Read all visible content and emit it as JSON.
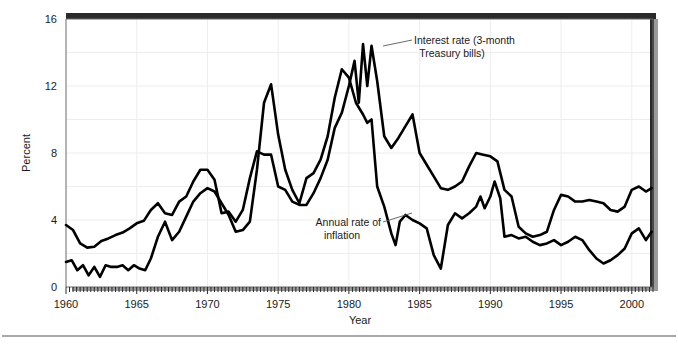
{
  "chart_data": {
    "type": "line",
    "title": "",
    "xlabel": "Year",
    "ylabel": "Percent",
    "xlim": [
      1960,
      2001.5
    ],
    "ylim": [
      0,
      16
    ],
    "yticks": [
      0,
      4,
      8,
      12,
      16
    ],
    "xticks": [
      1960,
      1965,
      1970,
      1975,
      1980,
      1985,
      1990,
      1995,
      2000
    ],
    "grid": "both-light",
    "legend": "inline-annotations",
    "minor_tick_interval": 0.25,
    "series": [
      {
        "name": "Interest rate (3-month Treasury bills)",
        "color": "#000000",
        "x": [
          1960.0,
          1960.5,
          1961.0,
          1961.5,
          1962.0,
          1962.5,
          1963.0,
          1963.5,
          1964.0,
          1964.5,
          1965.0,
          1965.5,
          1966.0,
          1966.5,
          1967.0,
          1967.5,
          1968.0,
          1968.5,
          1969.0,
          1969.5,
          1970.0,
          1970.5,
          1971.0,
          1971.5,
          1972.0,
          1972.5,
          1973.0,
          1973.5,
          1974.0,
          1974.5,
          1975.0,
          1975.5,
          1976.0,
          1976.5,
          1977.0,
          1977.5,
          1978.0,
          1978.5,
          1979.0,
          1979.5,
          1980.0,
          1980.4,
          1980.7,
          1981.0,
          1981.3,
          1981.6,
          1982.0,
          1982.5,
          1983.0,
          1983.5,
          1984.0,
          1984.5,
          1985.0,
          1985.5,
          1986.0,
          1986.5,
          1987.0,
          1987.5,
          1988.0,
          1988.5,
          1989.0,
          1989.5,
          1990.0,
          1990.5,
          1991.0,
          1991.5,
          1992.0,
          1992.5,
          1993.0,
          1993.5,
          1994.0,
          1994.5,
          1995.0,
          1995.5,
          1996.0,
          1996.5,
          1997.0,
          1997.5,
          1998.0,
          1998.5,
          1999.0,
          1999.5,
          2000.0,
          2000.5,
          2001.0,
          2001.4
        ],
        "y": [
          3.7,
          3.4,
          2.6,
          2.35,
          2.4,
          2.75,
          2.9,
          3.1,
          3.25,
          3.5,
          3.8,
          3.95,
          4.6,
          5.0,
          4.4,
          4.3,
          5.1,
          5.4,
          6.3,
          7.0,
          7.0,
          6.4,
          4.4,
          4.5,
          3.9,
          4.6,
          6.5,
          8.1,
          7.9,
          7.9,
          6.0,
          5.8,
          5.1,
          4.9,
          4.9,
          5.6,
          6.5,
          7.6,
          9.5,
          10.4,
          12.0,
          13.5,
          11.0,
          14.5,
          12.0,
          14.4,
          12.3,
          9.0,
          8.3,
          8.9,
          9.6,
          10.3,
          8.0,
          7.3,
          6.6,
          5.9,
          5.8,
          6.0,
          6.3,
          7.2,
          8.0,
          7.9,
          7.8,
          7.5,
          5.8,
          5.4,
          3.6,
          3.2,
          3.0,
          3.1,
          3.3,
          4.6,
          5.5,
          5.4,
          5.1,
          5.1,
          5.2,
          5.1,
          5.0,
          4.6,
          4.5,
          4.8,
          5.8,
          6.0,
          5.7,
          5.9
        ]
      },
      {
        "name": "Annual rate of inflation",
        "color": "#000000",
        "x": [
          1960.0,
          1960.4,
          1960.8,
          1961.2,
          1961.6,
          1962.0,
          1962.4,
          1962.8,
          1963.2,
          1963.6,
          1964.0,
          1964.4,
          1964.8,
          1965.2,
          1965.6,
          1966.0,
          1966.5,
          1967.0,
          1967.5,
          1968.0,
          1968.5,
          1969.0,
          1969.5,
          1970.0,
          1970.5,
          1971.0,
          1971.5,
          1972.0,
          1972.5,
          1973.0,
          1973.5,
          1974.0,
          1974.5,
          1975.0,
          1975.5,
          1976.0,
          1976.5,
          1977.0,
          1977.5,
          1978.0,
          1978.5,
          1979.0,
          1979.5,
          1980.0,
          1980.5,
          1981.0,
          1981.3,
          1981.6,
          1982.0,
          1982.5,
          1983.0,
          1983.3,
          1983.6,
          1984.0,
          1984.5,
          1985.0,
          1985.5,
          1986.0,
          1986.5,
          1987.0,
          1987.5,
          1988.0,
          1988.5,
          1989.0,
          1989.3,
          1989.6,
          1990.0,
          1990.3,
          1990.7,
          1991.0,
          1991.5,
          1992.0,
          1992.5,
          1993.0,
          1993.5,
          1994.0,
          1994.5,
          1995.0,
          1995.5,
          1996.0,
          1996.5,
          1997.0,
          1997.5,
          1998.0,
          1998.5,
          1999.0,
          1999.5,
          2000.0,
          2000.5,
          2001.0,
          2001.4
        ],
        "y": [
          1.5,
          1.6,
          1.0,
          1.3,
          0.7,
          1.2,
          0.6,
          1.3,
          1.2,
          1.2,
          1.3,
          1.0,
          1.3,
          1.1,
          1.0,
          1.7,
          3.0,
          3.9,
          2.8,
          3.3,
          4.2,
          5.1,
          5.6,
          5.9,
          5.7,
          5.0,
          4.3,
          3.3,
          3.4,
          3.9,
          7.0,
          11.0,
          12.1,
          9.1,
          7.0,
          5.8,
          5.0,
          6.5,
          6.8,
          7.6,
          9.0,
          11.3,
          13.0,
          12.5,
          11.0,
          10.3,
          9.8,
          10.0,
          6.0,
          4.8,
          3.2,
          2.5,
          3.9,
          4.3,
          4.0,
          3.8,
          3.5,
          1.9,
          1.1,
          3.7,
          4.4,
          4.1,
          4.4,
          4.8,
          5.4,
          4.7,
          5.4,
          6.3,
          5.3,
          3.0,
          3.1,
          2.9,
          3.0,
          2.7,
          2.5,
          2.6,
          2.8,
          2.5,
          2.7,
          3.0,
          2.8,
          2.2,
          1.7,
          1.4,
          1.6,
          1.9,
          2.3,
          3.2,
          3.5,
          2.8,
          3.3
        ]
      }
    ],
    "annotations": [
      {
        "id": "interest-rate-annotation",
        "line1": "Interest rate (3-month",
        "line2": "Treasury bills)"
      },
      {
        "id": "inflation-annotation",
        "line1": "Annual rate of",
        "line2": "inflation"
      }
    ]
  },
  "axes": {
    "y_label": "Percent",
    "x_label": "Year",
    "y_tick_labels": [
      "0",
      "4",
      "8",
      "12",
      "16"
    ],
    "x_tick_labels": [
      "1960",
      "1965",
      "1970",
      "1975",
      "1980",
      "1985",
      "1990",
      "1995",
      "2000"
    ]
  },
  "colors": {
    "series": "#000000",
    "grid": "#ededed",
    "frame": "#6b6b6b",
    "shadow": "#2a2a2a",
    "text": "#1a1a1a",
    "rule": "#8c8c8c",
    "background": "#ffffff"
  }
}
